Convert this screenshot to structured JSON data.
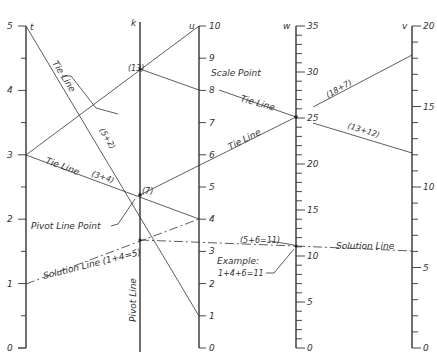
{
  "diagram": {
    "type": "nomograph",
    "axes": [
      {
        "name": "t",
        "x": 26,
        "min": 0,
        "max": 5,
        "y_min": 348,
        "y_max": 26,
        "major_labels": [
          "0",
          "1",
          "2",
          "3",
          "4",
          "5"
        ],
        "minor_step": 0.5
      },
      {
        "name": "k",
        "x": 140,
        "role": "Pivot Line"
      },
      {
        "name": "u",
        "x": 199,
        "min": 0,
        "max": 10,
        "y_min": 348,
        "y_max": 26,
        "major_labels": [
          "0",
          "1",
          "2",
          "3",
          "4",
          "5",
          "6",
          "7",
          "8",
          "9",
          "10"
        ]
      },
      {
        "name": "w",
        "x": 296,
        "min": 0,
        "max": 35,
        "y_min": 348,
        "y_max": 26,
        "major_labels": [
          "0",
          "5",
          "10",
          "15",
          "20",
          "25",
          "30",
          "35"
        ],
        "minor_step": 1
      },
      {
        "name": "v",
        "x": 412,
        "min": 0,
        "max": 20,
        "y_min": 348,
        "y_max": 26,
        "major_labels": [
          "0",
          "5",
          "10",
          "15",
          "20"
        ],
        "minor_step": 1
      }
    ],
    "labels": {
      "tie_line_1": "Tie Line",
      "tie_line_2": "Tie Line",
      "tie_line_3": "Tie Line",
      "tie_line_4": "Tie Line",
      "sum_5_2": "(5+2)",
      "sum_3_4": "(3+4)",
      "k13": "(13)",
      "k7": "(7)",
      "scale_point": "Scale Point",
      "sum_18_7": "(18+7)",
      "sum_13_12": "(13+12)",
      "pivot_line_point": "Pivot Line Point",
      "solution_line_left": "Solution Line (1+4=5)",
      "pivot_line": "Pivot Line",
      "sum_5_6_11": "(5+6=11)",
      "example_title": "Example:",
      "example_eq": "1+4+6=11",
      "solution_line_right": "Solution Line"
    }
  }
}
